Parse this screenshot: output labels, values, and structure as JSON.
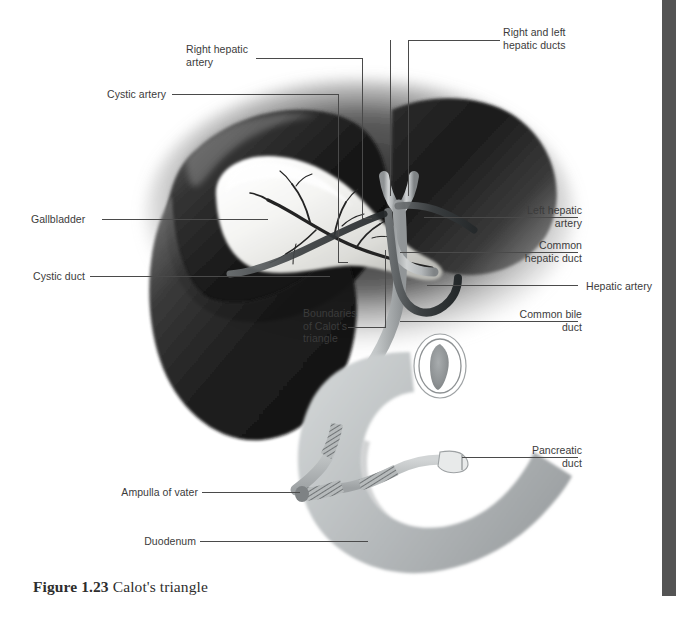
{
  "figure": {
    "number": "Figure 1.23",
    "title": "Calot's triangle",
    "caption": "Figure 1.23 Calot's triangle"
  },
  "labels": {
    "right_hepatic_artery": "Right hepatic\nartery",
    "cystic_artery": "Cystic artery",
    "right_and_left_hepatic_ducts": "Right and left\nhepatic ducts",
    "gallbladder": "Gallbladder",
    "cystic_duct": "Cystic duct",
    "boundaries_of_calots_triangle": "Boundaries\nof Calot's\ntriangle",
    "left_hepatic_artery": "Left hepatic\nartery",
    "common_hepatic_duct": "Common\nhepatic duct",
    "hepatic_artery": "Hepatic artery",
    "common_bile_duct": "Common bile\nduct",
    "pancreatic_duct": "Pancreatic\nduct",
    "ampulla_of_vater": "Ampulla of vater",
    "duodenum": "Duodenum"
  },
  "colors": {
    "background": "#ffffff",
    "label_text": "#3b3b3b",
    "caption_text": "#2e2e2e",
    "leader_line": "#4a4a4a",
    "liver_dark": "#1d1d1d",
    "liver_mid": "#4a4a4a",
    "gallbladder_light": "#f2f2f0",
    "duct_gray": "#b9bcbd",
    "duodenum_gray": "#c4c7c8",
    "edge_bar": "#545454"
  }
}
